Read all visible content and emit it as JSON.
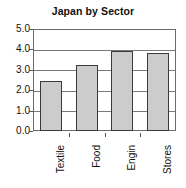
{
  "chart_data": {
    "type": "bar",
    "title": "Japan by Sector",
    "xlabel": "",
    "ylabel": "",
    "categories": [
      "Textile",
      "Food",
      "Engin",
      "Stores"
    ],
    "values": [
      2.45,
      3.25,
      3.9,
      3.8
    ],
    "ylim": [
      0.0,
      5.0
    ],
    "ytick_labels": [
      "5.0",
      "4.0",
      "3.0",
      "2.0",
      "1.0",
      "0.0"
    ],
    "ytick_values": [
      5.0,
      4.0,
      3.0,
      2.0,
      1.0,
      0.0
    ],
    "grid": true,
    "legend": false,
    "legend_position": "none",
    "colors": {
      "bar_fill": "#cccccc",
      "bar_border": "#3a3a3a",
      "gridline": "#7a7a7a",
      "axis": "#6b6b6b",
      "text": "#111111",
      "background": "#ffffff"
    },
    "category_label_rotation": -90
  }
}
